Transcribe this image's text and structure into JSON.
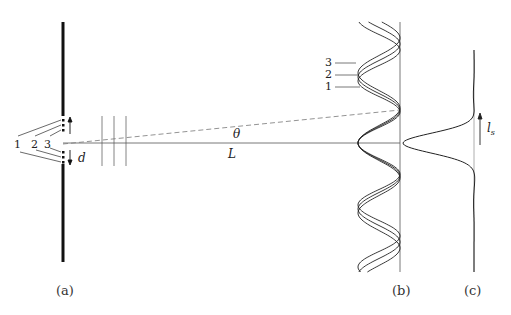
{
  "figure": {
    "panels": {
      "a": {
        "caption": "(a)"
      },
      "b": {
        "caption": "(b)"
      },
      "c": {
        "caption": "(c)"
      }
    },
    "source_labels": [
      "1",
      "2",
      "3"
    ],
    "pattern_labels": [
      "3",
      "2",
      "1"
    ],
    "symbols": {
      "slit_separation": "d",
      "angle": "θ",
      "distance": "L",
      "coherence_length": "l",
      "coherence_subscript": "s"
    }
  }
}
